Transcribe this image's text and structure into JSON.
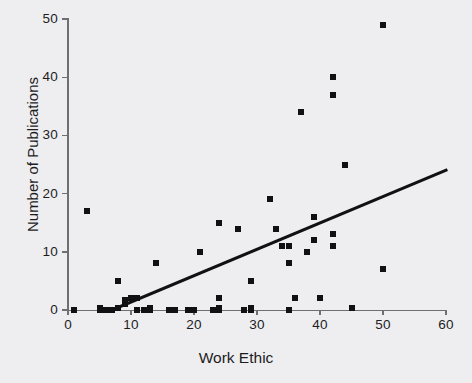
{
  "chart_data": {
    "type": "scatter",
    "title": "",
    "xlabel": "Work Ethic",
    "ylabel": "Number of Publications",
    "xlim": [
      0,
      60
    ],
    "ylim": [
      0,
      50
    ],
    "xticks": [
      0,
      10,
      20,
      30,
      40,
      50,
      60
    ],
    "yticks": [
      0,
      10,
      20,
      30,
      40,
      50
    ],
    "xtick_labels": [
      "0",
      "10",
      "20",
      "30",
      "40",
      "50",
      "60"
    ],
    "ytick_labels": [
      "0",
      "10",
      "20",
      "30",
      "40",
      "50"
    ],
    "grid": false,
    "legend": null,
    "marker": "square",
    "marker_color": "#111114",
    "background_color": "#eeeef0",
    "axis_color": "#6e6e73",
    "points": [
      [
        1,
        0
      ],
      [
        3,
        17
      ],
      [
        5,
        0
      ],
      [
        5,
        0.4
      ],
      [
        6,
        0
      ],
      [
        7,
        0
      ],
      [
        8,
        0.4
      ],
      [
        8,
        5
      ],
      [
        9,
        1
      ],
      [
        9,
        1.8
      ],
      [
        10,
        2
      ],
      [
        11,
        0
      ],
      [
        11,
        2
      ],
      [
        12,
        0
      ],
      [
        13,
        0
      ],
      [
        13,
        0.4
      ],
      [
        14,
        8
      ],
      [
        16,
        0
      ],
      [
        17,
        0
      ],
      [
        19,
        0
      ],
      [
        20,
        0
      ],
      [
        21,
        10
      ],
      [
        23,
        0
      ],
      [
        24,
        0
      ],
      [
        24,
        0.4
      ],
      [
        24,
        2
      ],
      [
        24,
        15
      ],
      [
        27,
        14
      ],
      [
        28,
        0
      ],
      [
        29,
        0
      ],
      [
        29,
        0.4
      ],
      [
        29,
        5
      ],
      [
        32,
        19
      ],
      [
        33,
        14
      ],
      [
        34,
        11
      ],
      [
        35,
        0
      ],
      [
        35,
        8
      ],
      [
        35,
        11
      ],
      [
        36,
        2
      ],
      [
        37,
        34
      ],
      [
        38,
        10
      ],
      [
        39,
        12
      ],
      [
        39,
        16
      ],
      [
        40,
        2
      ],
      [
        42,
        11
      ],
      [
        42,
        13
      ],
      [
        42,
        37
      ],
      [
        42,
        40
      ],
      [
        44,
        25
      ],
      [
        45,
        0.4
      ],
      [
        50,
        7
      ],
      [
        50,
        49
      ]
    ],
    "fit_line": {
      "type": "linear-regression",
      "x_start": 7,
      "y_start": 0,
      "x_end": 60,
      "y_end": 24,
      "color": "#111114",
      "width": 3
    }
  }
}
